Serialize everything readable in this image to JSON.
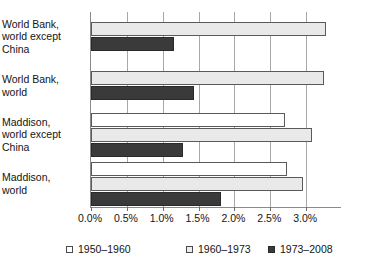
{
  "chart_data": {
    "type": "bar",
    "orientation": "horizontal",
    "title": "",
    "xlabel": "",
    "ylabel": "",
    "xlim": [
      0,
      3.5
    ],
    "xticks": [
      "0.0%",
      "0.5%",
      "1.0%",
      "1.5%",
      "2.0%",
      "2.5%",
      "3.0%"
    ],
    "xtick_values": [
      0.0,
      0.5,
      1.0,
      1.5,
      2.0,
      2.5,
      3.0
    ],
    "grid": "vertical",
    "legend_position": "bottom",
    "units": "percent",
    "categories": [
      "World Bank,\nworld except\nChina",
      "World Bank,\nworld",
      "Maddison,\nworld except\nChina",
      "Maddison,\nworld"
    ],
    "series": [
      {
        "name": "1950–1960",
        "color": "#ffffff",
        "values": [
          null,
          null,
          2.71,
          2.73
        ]
      },
      {
        "name": "1960–1973",
        "color": "#e9e9e9",
        "values": [
          3.28,
          3.25,
          3.08,
          2.96
        ]
      },
      {
        "name": "1973–2008",
        "color": "#3a3a3a",
        "values": [
          1.16,
          1.43,
          1.28,
          1.81
        ]
      }
    ]
  },
  "legend": {
    "items": [
      {
        "label": "1950–1960"
      },
      {
        "label": "1960–1973"
      },
      {
        "label": "1973–2008"
      }
    ]
  }
}
